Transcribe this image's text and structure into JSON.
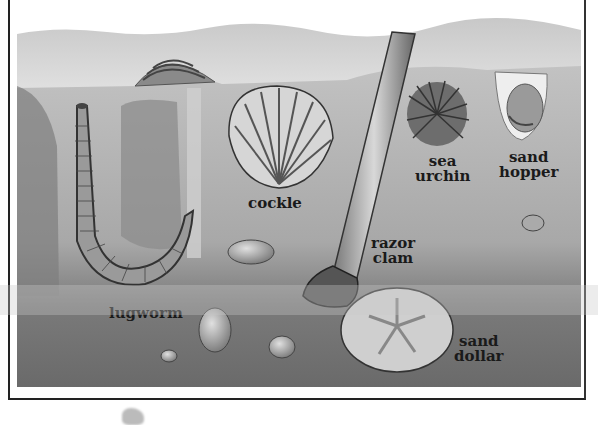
{
  "figure": {
    "colors": {
      "sky": "#d8d8d8",
      "sand_light": "#bdbdbd",
      "sand_dark": "#6e6e6e",
      "label": "#1a1a1a",
      "frame": "#222222"
    },
    "labels": [
      {
        "id": "lugworm",
        "text": "lugworm"
      },
      {
        "id": "cockle",
        "text": "cockle"
      },
      {
        "id": "razor_clam",
        "line1": "razor",
        "line2": "clam"
      },
      {
        "id": "sea_urchin",
        "line1": "sea",
        "line2": "urchin"
      },
      {
        "id": "sand_hopper",
        "line1": "sand",
        "line2": "hopper"
      },
      {
        "id": "sand_dollar",
        "line1": "sand",
        "line2": "dollar"
      }
    ]
  }
}
